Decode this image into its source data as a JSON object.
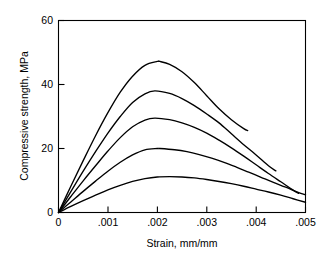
{
  "chart_data": {
    "type": "line",
    "title": "",
    "xlabel": "Strain, mm/mm",
    "ylabel": "Compressive strength, MPa",
    "xlim": [
      0,
      0.005
    ],
    "ylim": [
      0,
      60
    ],
    "xticks": [
      0,
      0.001,
      0.002,
      0.003,
      0.004,
      0.005
    ],
    "xticklabels": [
      "0",
      ".001",
      ".002",
      ".003",
      ".004",
      ".005"
    ],
    "yticks": [
      0,
      20,
      40,
      60
    ],
    "yticklabels": [
      "0",
      "20",
      "40",
      "60"
    ],
    "grid": false,
    "legend": "none",
    "frame": "box",
    "series": [
      {
        "name": "curve-1",
        "peak": {
          "x": 0.00205,
          "y": 47.2
        },
        "x": [
          0,
          0.00025,
          0.0005,
          0.00075,
          0.001,
          0.00125,
          0.0015,
          0.00175,
          0.002,
          0.00205,
          0.00225,
          0.0025,
          0.00275,
          0.003,
          0.00325,
          0.0035,
          0.00375,
          0.00383
        ],
        "y": [
          0,
          8.2,
          16.2,
          24.0,
          31.2,
          37.6,
          42.6,
          46.0,
          47.2,
          47.2,
          46.3,
          44.0,
          40.6,
          36.5,
          32.4,
          29.0,
          26.2,
          25.6
        ]
      },
      {
        "name": "curve-2",
        "peak": {
          "x": 0.00195,
          "y": 38.0
        },
        "x": [
          0,
          0.00025,
          0.0005,
          0.00075,
          0.001,
          0.00125,
          0.0015,
          0.00175,
          0.00195,
          0.00225,
          0.0025,
          0.00275,
          0.003,
          0.00325,
          0.0035,
          0.00375,
          0.004,
          0.00425,
          0.0044
        ],
        "y": [
          0,
          6.5,
          12.9,
          19.0,
          24.8,
          30.0,
          34.4,
          37.1,
          38.0,
          37.2,
          35.6,
          33.4,
          30.8,
          28.0,
          24.6,
          21.2,
          18.0,
          14.6,
          13.0
        ]
      },
      {
        "name": "curve-3",
        "peak": {
          "x": 0.00195,
          "y": 29.5
        },
        "x": [
          0,
          0.00025,
          0.0005,
          0.00075,
          0.001,
          0.00125,
          0.0015,
          0.00175,
          0.00195,
          0.00225,
          0.0025,
          0.00275,
          0.003,
          0.00325,
          0.0035,
          0.00375,
          0.004,
          0.00425,
          0.0045,
          0.00475,
          0.00486
        ],
        "y": [
          0,
          5.0,
          9.9,
          14.6,
          19.2,
          23.4,
          26.8,
          28.9,
          29.5,
          29.0,
          28.0,
          26.6,
          24.8,
          22.6,
          20.2,
          17.6,
          14.9,
          12.2,
          9.6,
          7.0,
          6.0
        ]
      },
      {
        "name": "curve-4",
        "peak": {
          "x": 0.00205,
          "y": 20.0
        },
        "x": [
          0,
          0.00025,
          0.0005,
          0.00075,
          0.001,
          0.00125,
          0.0015,
          0.00175,
          0.002,
          0.00205,
          0.00235,
          0.0026,
          0.00285,
          0.0031,
          0.00335,
          0.0036,
          0.00385,
          0.0041,
          0.00435,
          0.0046,
          0.00485,
          0.005
        ],
        "y": [
          0,
          3.3,
          6.6,
          9.8,
          12.9,
          15.7,
          18.0,
          19.6,
          20.0,
          20.0,
          19.6,
          19.0,
          18.1,
          17.0,
          15.7,
          14.2,
          12.6,
          11.0,
          9.4,
          7.9,
          6.3,
          5.5
        ]
      },
      {
        "name": "curve-5",
        "peak": {
          "x": 0.00225,
          "y": 11.2
        },
        "x": [
          0,
          0.00025,
          0.0005,
          0.00075,
          0.001,
          0.00125,
          0.0015,
          0.00175,
          0.002,
          0.00225,
          0.0025,
          0.00275,
          0.003,
          0.00325,
          0.0035,
          0.00375,
          0.004,
          0.00425,
          0.0045,
          0.00475,
          0.005
        ],
        "y": [
          0,
          1.9,
          3.7,
          5.4,
          7.1,
          8.5,
          9.7,
          10.6,
          11.1,
          11.2,
          11.1,
          10.8,
          10.3,
          9.7,
          9.0,
          8.2,
          7.3,
          6.4,
          5.4,
          4.3,
          3.2
        ]
      }
    ]
  },
  "axes": {
    "ylabel_text": "Compressive strength, MPa",
    "xlabel_text": "Strain, mm/mm",
    "ytick_0": "0",
    "ytick_20": "20",
    "ytick_40": "40",
    "ytick_60": "60",
    "xtick_0": "0",
    "xtick_1": ".001",
    "xtick_2": ".002",
    "xtick_3": ".003",
    "xtick_4": ".004",
    "xtick_5": ".005"
  },
  "colors": {
    "background": "#ffffff",
    "ink": "#000000"
  }
}
